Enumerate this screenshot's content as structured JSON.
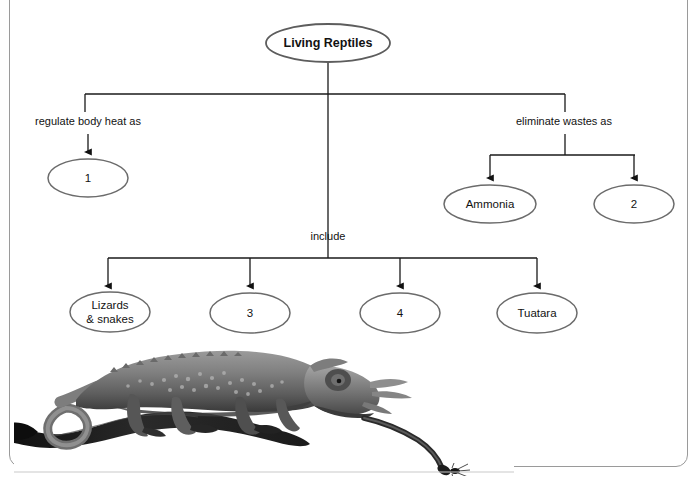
{
  "page": {
    "background_color": "#ffffff",
    "border_color": "#9a9a9a"
  },
  "diagram": {
    "type": "concept-map",
    "root": {
      "id": "root",
      "label": "Living Reptiles",
      "bold": true,
      "cx": 328,
      "cy": 43,
      "rx": 62,
      "ry": 19
    },
    "branches": [
      {
        "id": "branch-thermoregulation",
        "edge_label": "regulate body heat as",
        "edge_label_x": 88,
        "edge_label_y": 125,
        "nodes": [
          {
            "id": "node-1",
            "label": "1",
            "cx": 88,
            "cy": 178,
            "rx": 40,
            "ry": 19
          }
        ]
      },
      {
        "id": "branch-excretion",
        "edge_label": "eliminate wastes as",
        "edge_label_x": 564,
        "edge_label_y": 125,
        "nodes": [
          {
            "id": "node-ammonia",
            "label": "Ammonia",
            "cx": 490,
            "cy": 204,
            "rx": 46,
            "ry": 19
          },
          {
            "id": "node-2",
            "label": "2",
            "cx": 634,
            "cy": 204,
            "rx": 40,
            "ry": 19
          }
        ]
      },
      {
        "id": "branch-include",
        "edge_label": "include",
        "edge_label_x": 328,
        "edge_label_y": 240,
        "nodes": [
          {
            "id": "node-lizards-snakes",
            "label": "Lizards",
            "label2": "& snakes",
            "cx": 110,
            "cy": 312,
            "rx": 40,
            "ry": 20
          },
          {
            "id": "node-3",
            "label": "3",
            "cx": 250,
            "cy": 313,
            "rx": 40,
            "ry": 20
          },
          {
            "id": "node-4",
            "label": "4",
            "cx": 400,
            "cy": 313,
            "rx": 40,
            "ry": 20
          },
          {
            "id": "node-tuatara",
            "label": "Tuatara",
            "cx": 537,
            "cy": 313,
            "rx": 40,
            "ry": 20
          }
        ]
      }
    ],
    "colors": {
      "line": "#1a1a1a",
      "ellipse_stroke": "#5d5d5d",
      "ellipse_fill": "#ffffff",
      "text": "#121212"
    }
  },
  "photo": {
    "caption": "",
    "subject": "Jackson's chameleon on a branch with tongue extended catching an insect",
    "style": "grayscale-photograph"
  }
}
